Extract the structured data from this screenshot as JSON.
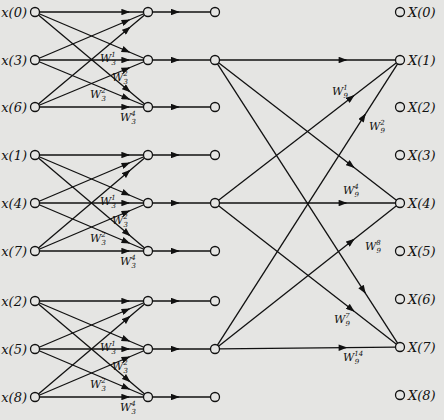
{
  "diagram": {
    "title": "",
    "type": "9-point FFT signal flow graph (3x3 decimation)",
    "colors": {
      "background": "#e5e5e3",
      "line": "#111111"
    },
    "input_labels": [
      "x(0)",
      "x(3)",
      "x(6)",
      "x(1)",
      "x(4)",
      "x(7)",
      "x(2)",
      "x(5)",
      "x(8)"
    ],
    "input_rows_y": [
      12,
      60,
      107,
      155,
      203,
      251,
      301,
      349,
      397
    ],
    "output_labels": [
      "X(0)",
      "X(1)",
      "X(2)",
      "X(3)",
      "X(4)",
      "X(5)",
      "X(6)",
      "X(7)",
      "X(8)"
    ],
    "output_rows_y": [
      12,
      60,
      107,
      155,
      203,
      251,
      299,
      347,
      395
    ],
    "columns_x": {
      "input": 35,
      "stage1": 148,
      "stage2": 215,
      "output": 400
    },
    "stage1_twiddles": [
      {
        "base": "W",
        "sub": "3",
        "sup": "1",
        "dx": 0,
        "dy": 0,
        "group_row": 1,
        "pos": "above-middle"
      },
      {
        "base": "W",
        "sub": "3",
        "sup": "2",
        "pos": "below-middle"
      },
      {
        "base": "W",
        "sub": "3",
        "sup": "2",
        "pos": "above-bottom"
      },
      {
        "base": "W",
        "sub": "3",
        "sup": "4",
        "pos": "below-bottom"
      }
    ],
    "stage2_twiddles": [
      {
        "label": "W",
        "sub": "9",
        "sup": "1",
        "x": 332,
        "y": 95
      },
      {
        "label": "W",
        "sub": "9",
        "sup": "2",
        "x": 369,
        "y": 130
      },
      {
        "label": "W",
        "sub": "9",
        "sup": "4",
        "x": 343,
        "y": 194
      },
      {
        "label": "W",
        "sub": "9",
        "sup": "8",
        "x": 365,
        "y": 250
      },
      {
        "label": "W",
        "sub": "9",
        "sup": "7",
        "x": 334,
        "y": 323
      },
      {
        "label": "W",
        "sub": "9",
        "sup": "14",
        "x": 343,
        "y": 361
      }
    ]
  }
}
